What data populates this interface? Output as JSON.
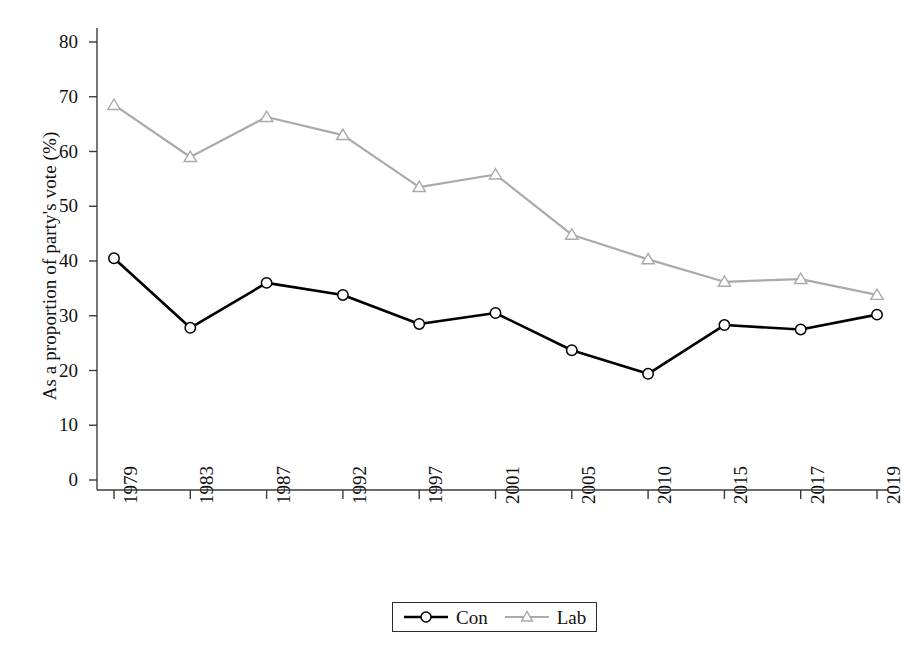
{
  "chart_data": {
    "type": "line",
    "title": "",
    "xlabel": "",
    "ylabel": "As a proportion of party's vote (%)",
    "categories": [
      "1979",
      "1983",
      "1987",
      "1992",
      "1997",
      "2001",
      "2005",
      "2010",
      "2015",
      "2017",
      "2019"
    ],
    "series": [
      {
        "name": "Con",
        "color": "#000000",
        "marker": "circle",
        "values": [
          40.5,
          27.8,
          36.0,
          33.8,
          28.5,
          30.5,
          23.7,
          19.4,
          28.3,
          27.5,
          30.2
        ]
      },
      {
        "name": "Lab",
        "color": "#aaaaaa",
        "marker": "triangle",
        "values": [
          68.5,
          59.0,
          66.3,
          63.0,
          53.5,
          55.8,
          44.8,
          40.3,
          36.2,
          36.7,
          33.8
        ]
      }
    ],
    "ylim": [
      0,
      80
    ],
    "y_ticks": [
      0,
      10,
      20,
      30,
      40,
      50,
      60,
      70,
      80
    ],
    "y_tick_labels": [
      "0",
      "10",
      "20",
      "30",
      "40",
      "50",
      "60",
      "70",
      "80"
    ],
    "grid": false,
    "legend_position": "bottom-center",
    "legend_entries": [
      "Con",
      "Lab"
    ],
    "axis_color": "#3c3c3c",
    "background": "#ffffff"
  }
}
